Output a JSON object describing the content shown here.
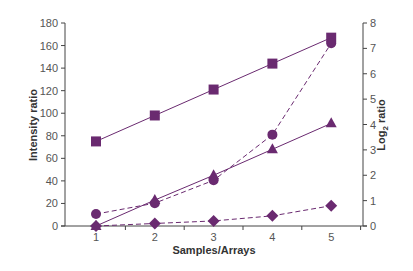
{
  "chart_data": {
    "type": "line",
    "title": "",
    "xlabel": "Samples/Arrays",
    "ylabel": "Intensity ratio",
    "y2label": "Log2 ratio",
    "x": [
      1,
      2,
      3,
      4,
      5
    ],
    "ylim": [
      0,
      180
    ],
    "y2lim": [
      0,
      8
    ],
    "yticks": [
      0,
      20,
      40,
      60,
      80,
      100,
      120,
      140,
      160,
      180
    ],
    "y2ticks": [
      0,
      1,
      2,
      3,
      4,
      5,
      6,
      7,
      8
    ],
    "grid": false,
    "legend": null,
    "series": [
      {
        "name": "Intensity ratio (squares)",
        "axis": "left",
        "marker": "square",
        "line": "solid",
        "values": [
          75,
          98,
          121,
          144,
          167
        ]
      },
      {
        "name": "Intensity ratio (triangles)",
        "axis": "left",
        "marker": "triangle",
        "line": "solid",
        "values": [
          0,
          23,
          45,
          68,
          91
        ]
      },
      {
        "name": "Log2 ratio (circles)",
        "axis": "right",
        "marker": "circle",
        "line": "dashed",
        "values": [
          0.47,
          0.9,
          1.8,
          3.6,
          7.2
        ]
      },
      {
        "name": "Log2 ratio (diamonds)",
        "axis": "right",
        "marker": "diamond",
        "line": "dashed",
        "values": [
          0,
          0.1,
          0.2,
          0.4,
          0.8
        ]
      }
    ]
  },
  "colors": {
    "series": "#6a2a70",
    "axis": "#444444",
    "text": "#555555"
  },
  "labels": {
    "x_title": "Samples/Arrays",
    "y_title": "Intensity ratio",
    "y2_title_main": "Log",
    "y2_title_sub": "2",
    "y2_title_rest": " ratio"
  }
}
